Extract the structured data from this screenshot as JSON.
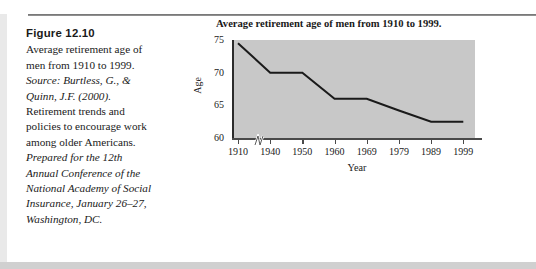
{
  "caption": {
    "figure_number": "Figure 12.10",
    "description": "Average retirement age of men from 1910 to 1999.",
    "source_label": "Source: Burtless, G., & Quinn, J.F. (2000).",
    "source_title_roman": "Retirement trends and policies to encourage work among older Americans.",
    "source_conference": "Prepared for the 12th Annual Conference of the National Academy of Social Insurance, January 26–27, Washington, DC."
  },
  "chart_data": {
    "type": "line",
    "title": "Average retirement age of men from 1910 to 1999.",
    "xlabel": "Year",
    "ylabel": "Age",
    "categories": [
      "1910",
      "1940",
      "1950",
      "1960",
      "1969",
      "1979",
      "1989",
      "1999"
    ],
    "values": [
      74.5,
      70.0,
      70.0,
      66.0,
      66.0,
      64.2,
      62.5,
      62.5
    ],
    "ylim": [
      60,
      75
    ],
    "yticks": [
      "60",
      "65",
      "70",
      "75"
    ],
    "ytick_values": [
      60,
      65,
      70,
      75
    ],
    "grid": false,
    "legend": null,
    "axis_break": true,
    "plot_background_color": "#c8c8c8",
    "line_color": "#1a1a1a"
  }
}
